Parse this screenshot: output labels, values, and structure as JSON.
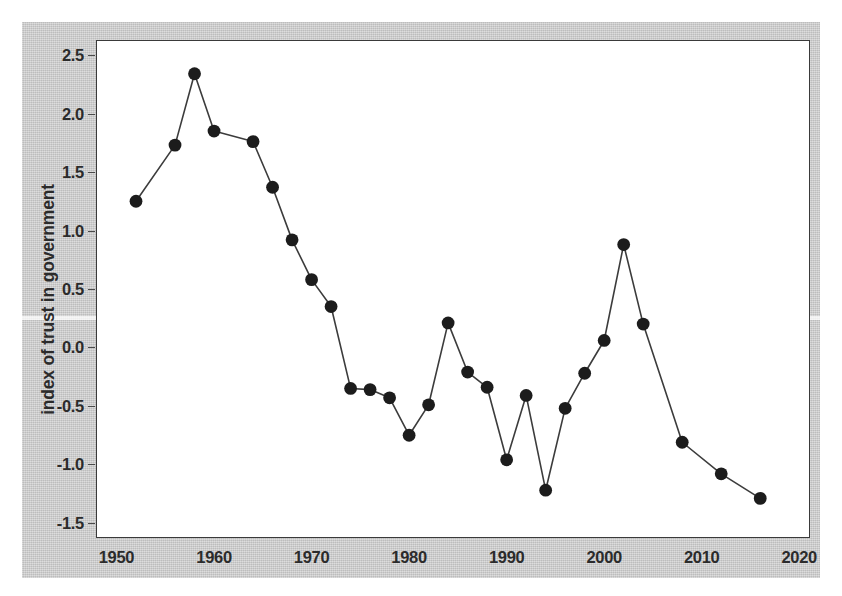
{
  "chart_data": {
    "type": "line",
    "title": "",
    "xlabel": "",
    "ylabel": "index of trust in government",
    "xlim": [
      1948,
      2021
    ],
    "ylim": [
      -1.62,
      2.62
    ],
    "xticks": [
      1950,
      1960,
      1970,
      1980,
      1990,
      2000,
      2010,
      2020
    ],
    "xtick_labels": [
      "1950",
      "1960",
      "1970",
      "1980",
      "1990",
      "2000",
      "2010",
      "2020"
    ],
    "yticks": [
      -1.5,
      -1.0,
      -0.5,
      0.0,
      0.5,
      1.0,
      1.5,
      2.0,
      2.5
    ],
    "ytick_labels": [
      "-1.5",
      "-1.0",
      "-0.5",
      "0.0",
      "0.5",
      "1.0",
      "1.5",
      "2.0",
      "2.5"
    ],
    "grid": false,
    "legend": null,
    "marker": "filled-circle",
    "marker_color": "#1c1c1c",
    "line_color": "#3c3c3c",
    "x": [
      1952,
      1956,
      1958,
      1960,
      1964,
      1966,
      1968,
      1970,
      1972,
      1974,
      1976,
      1978,
      1980,
      1982,
      1984,
      1986,
      1988,
      1990,
      1992,
      1994,
      1996,
      1998,
      2000,
      2002,
      2004,
      2008,
      2012,
      2016
    ],
    "values": [
      1.25,
      1.73,
      2.34,
      1.85,
      1.76,
      1.37,
      0.92,
      0.58,
      0.35,
      -0.35,
      -0.36,
      -0.43,
      -0.75,
      -0.49,
      0.21,
      -0.21,
      -0.34,
      -0.96,
      -0.41,
      -1.22,
      -0.52,
      -0.22,
      0.06,
      0.88,
      0.2,
      -0.81,
      -1.08,
      -1.29
    ]
  },
  "figure": {
    "panel_background": "#ffffff",
    "page_background": "#c9c9c9",
    "border_color": "#3a3a3a"
  }
}
